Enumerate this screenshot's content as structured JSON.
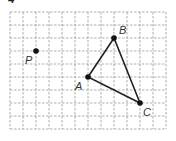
{
  "problem_number": "4",
  "grid": {
    "origin_px": [
      10,
      12
    ],
    "cell_px": 13,
    "columns": 12,
    "rows": 9,
    "line_style": "dashed",
    "line_color": "#9a9a9a"
  },
  "points": [
    {
      "name": "P",
      "label": "P",
      "grid": [
        2,
        3
      ],
      "label_offset": [
        -11,
        13
      ]
    },
    {
      "name": "A",
      "label": "A",
      "grid": [
        6,
        5
      ],
      "label_offset": [
        -13,
        13
      ]
    },
    {
      "name": "B",
      "label": "B",
      "grid": [
        8,
        2
      ],
      "label_offset": [
        5,
        -4
      ]
    },
    {
      "name": "C",
      "label": "C",
      "grid": [
        10,
        7
      ],
      "label_offset": [
        3,
        13
      ]
    }
  ],
  "triangle": {
    "vertices": [
      "A",
      "B",
      "C"
    ],
    "stroke_color": "#222222"
  }
}
